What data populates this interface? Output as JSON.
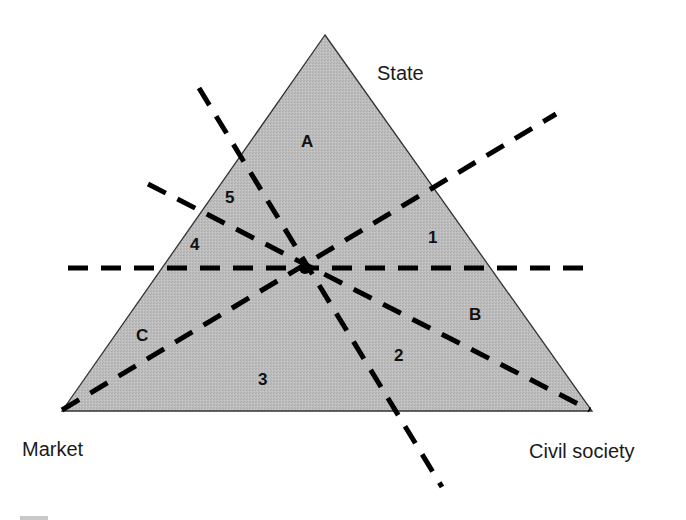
{
  "diagram": {
    "type": "triangle-welfare-mix",
    "colors": {
      "triangle_fill": "#b9b9b9",
      "triangle_stroke": "#333333",
      "dash_line": "#000000",
      "text": "#1a1a1a",
      "background": "#ffffff",
      "corner_mark": "#c8c8c8"
    },
    "vertices": [
      {
        "id": "state",
        "label": "State",
        "x": 325,
        "y": 35
      },
      {
        "id": "market",
        "label": "Market",
        "x": 62,
        "y": 411
      },
      {
        "id": "civil_society",
        "label": "Civil society",
        "x": 592,
        "y": 411
      }
    ],
    "vertex_labels": {
      "state": "State",
      "market": "Market",
      "civil_society": "Civil society"
    },
    "region_labels": {
      "A": "A",
      "B": "B",
      "C": "C",
      "r1": "1",
      "r2": "2",
      "r3": "3",
      "r4": "4",
      "r5": "5"
    },
    "center_intersection": {
      "x": 305,
      "y": 268
    },
    "dashed_lines": [
      {
        "id": "horizontal",
        "from": [
          68,
          268
        ],
        "to": [
          583,
          268
        ]
      },
      {
        "id": "steep-diagonal",
        "from": [
          199,
          88
        ],
        "to": [
          442,
          487
        ]
      },
      {
        "id": "market-to-upper-right",
        "from": [
          62,
          410
        ],
        "to": [
          556,
          114
        ]
      },
      {
        "id": "upper-left-to-civil-society",
        "from": [
          148,
          184
        ],
        "to": [
          590,
          410
        ]
      }
    ]
  }
}
